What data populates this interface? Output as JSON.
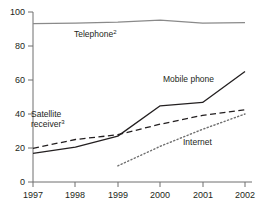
{
  "chart_data": {
    "type": "line",
    "title": "",
    "subtitle": "",
    "xlabel": "",
    "ylabel": "",
    "x": [
      1997,
      1998,
      1999,
      2000,
      2001,
      2002
    ],
    "xtick_labels": [
      "1997",
      "1998",
      "1999",
      "2000",
      "2001",
      "2002"
    ],
    "ytick_labels": [
      "0",
      "20",
      "40",
      "60",
      "80",
      "100"
    ],
    "ytick_values": [
      0,
      20,
      40,
      60,
      80,
      100
    ],
    "xlim": [
      1997,
      2002
    ],
    "ylim": [
      0,
      100
    ],
    "grid": false,
    "legend_position": "inline-annotations",
    "series": [
      {
        "name": "Telephone",
        "label": "Telephone",
        "label_superscript": "2",
        "style": "solid",
        "color": "#8a8a8a",
        "x": [
          1997,
          1998,
          1999,
          2000,
          2001,
          2002
        ],
        "values": [
          93.2,
          93.4,
          94.0,
          95.2,
          93.4,
          93.8
        ]
      },
      {
        "name": "Mobile phone",
        "label": "Mobile phone",
        "label_superscript": "",
        "style": "solid",
        "color": "#231f20",
        "x": [
          1997,
          1998,
          1999,
          2000,
          2001,
          2002
        ],
        "values": [
          16.8,
          20.5,
          27.0,
          44.8,
          46.8,
          65.0
        ]
      },
      {
        "name": "Satellite receiver",
        "label": "Satellite receiver",
        "label_superscript": "3",
        "style": "dashed",
        "color": "#231f20",
        "x": [
          1997,
          1998,
          1999,
          2000,
          2001,
          2002
        ],
        "values": [
          19.8,
          25.0,
          27.8,
          34.0,
          39.2,
          42.5
        ]
      },
      {
        "name": "Internet",
        "label": "Internet",
        "label_superscript": "",
        "style": "dotted",
        "color": "#6f6f6f",
        "x": [
          1999,
          2000,
          2001,
          2002
        ],
        "values": [
          9.5,
          21.0,
          31.0,
          40.0
        ]
      }
    ],
    "annotations": [
      {
        "text": "Telephone",
        "superscript": "2",
        "x_px": 74,
        "y_px": 37
      },
      {
        "text": "Mobile phone",
        "superscript": "",
        "x_px": 163,
        "y_px": 82
      },
      {
        "text": "Satellite",
        "superscript": "",
        "x_px": 31,
        "y_px": 117
      },
      {
        "text": "receiver",
        "superscript": "3",
        "x_px": 31,
        "y_px": 127
      },
      {
        "text": "Internet",
        "superscript": "",
        "x_px": 183,
        "y_px": 145
      }
    ]
  },
  "axis": {
    "y_ticks": [
      "100",
      "80",
      "60",
      "40",
      "20",
      "0"
    ],
    "x_ticks": [
      "1997",
      "1998",
      "1999",
      "2000",
      "2001",
      "2002"
    ]
  }
}
